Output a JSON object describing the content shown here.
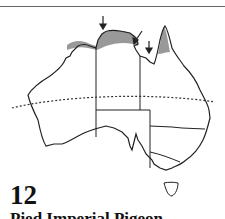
{
  "map": {
    "region": "Australia",
    "number": "12",
    "title": "Pied Imperial Pigeon",
    "shaded_range_color": "#999999",
    "outline_color": "#222222",
    "tropic_line": "dotted"
  }
}
